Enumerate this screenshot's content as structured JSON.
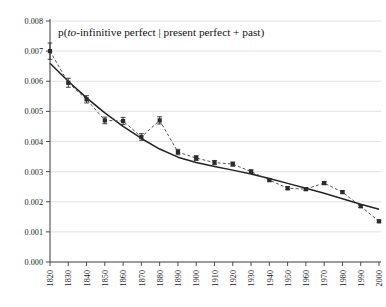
{
  "chart_data": {
    "type": "line",
    "title": "p(to-infinitive perfect | present perfect + past)",
    "title_parts": {
      "lead": "p(",
      "italic": "to",
      "rest": "-infinitive perfect | present perfect + past)"
    },
    "xlabel": "",
    "ylabel": "",
    "x": [
      1820,
      1830,
      1840,
      1850,
      1860,
      1870,
      1880,
      1890,
      1900,
      1910,
      1920,
      1930,
      1940,
      1950,
      1960,
      1970,
      1980,
      1990,
      2000
    ],
    "categories": [
      "1820",
      "1830",
      "1840",
      "1850",
      "1860",
      "1870",
      "1880",
      "1890",
      "1900",
      "1910",
      "1920",
      "1930",
      "1940",
      "1950",
      "1960",
      "1970",
      "1980",
      "1990",
      "2000"
    ],
    "values": [
      0.007,
      0.00595,
      0.0054,
      0.0047,
      0.00468,
      0.00415,
      0.0047,
      0.00365,
      0.00345,
      0.0033,
      0.00325,
      0.003,
      0.00272,
      0.00245,
      0.00242,
      0.00262,
      0.00232,
      0.00185,
      0.00135
    ],
    "error_upper": [
      0.00027,
      0.00015,
      0.00012,
      0.00011,
      0.00012,
      0.00011,
      0.00012,
      9e-05,
      8e-05,
      7e-05,
      7e-05,
      6e-05,
      5e-05,
      5e-05,
      5e-05,
      5e-05,
      4e-05,
      4e-05,
      4e-05
    ],
    "error_lower": [
      0.00027,
      0.00015,
      0.00012,
      0.00011,
      0.00012,
      0.00011,
      0.00012,
      9e-05,
      8e-05,
      7e-05,
      7e-05,
      6e-05,
      5e-05,
      5e-05,
      5e-05,
      5e-05,
      4e-05,
      4e-05,
      4e-05
    ],
    "trend": {
      "name": "fitted-trend",
      "values": [
        0.0066,
        0.006,
        0.00545,
        0.00495,
        0.0045,
        0.0041,
        0.00375,
        0.00348,
        0.0033,
        0.00317,
        0.00305,
        0.00292,
        0.00277,
        0.00261,
        0.00245,
        0.00228,
        0.0021,
        0.00192,
        0.00175
      ]
    },
    "yticks": [
      "0.000",
      "0.001",
      "0.002",
      "0.003",
      "0.004",
      "0.005",
      "0.006",
      "0.007",
      "0.008"
    ],
    "ytick_values": [
      0.0,
      0.001,
      0.002,
      0.003,
      0.004,
      0.005,
      0.006,
      0.007,
      0.008
    ],
    "ylim": [
      0.0,
      0.008
    ],
    "xlim": [
      1820,
      2000
    ],
    "grid": true,
    "legend": "none",
    "marker": "filled-square",
    "series_line_style": "dashed",
    "trend_line_style": "solid",
    "colors": {
      "marker": "#2b2b2b",
      "series_line": "#555555",
      "trend_line": "#232323",
      "grid": "#d9d9d9",
      "axis": "#4a4a4a",
      "text": "#1b1b1b",
      "background": "#ffffff"
    }
  }
}
